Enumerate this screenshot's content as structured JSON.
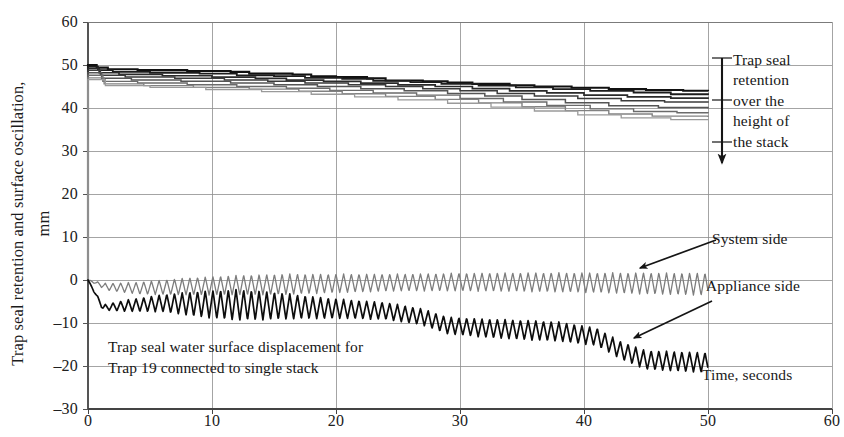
{
  "chart_data": {
    "type": "line",
    "title": "",
    "xlabel": "Time, seconds",
    "ylabel": "Trap seal retention and surface oscillation,\nmm",
    "xlim": [
      0,
      60
    ],
    "ylim": [
      -30,
      60
    ],
    "xticks": [
      "0",
      "10",
      "20",
      "30",
      "40",
      "50",
      "60"
    ],
    "yticks": [
      "60",
      "50",
      "40",
      "30",
      "20",
      "10",
      "0",
      "–10",
      "–20",
      "–30"
    ],
    "grid": true,
    "legend_position": "inline-annotations",
    "annotations": [
      {
        "name": "trap-seal-retention-bracket",
        "text": "Trap seal\nretention\nover the\nheight of\nthe stack",
        "arrow": "down"
      },
      {
        "name": "system-side-callout",
        "text": "System side",
        "arrow": "down-left"
      },
      {
        "name": "appliance-side-callout",
        "text": "Appliance side",
        "arrow": "down-left"
      },
      {
        "name": "caption",
        "text": "Trap seal water surface displacement for\nTrap 19 connected to single stack",
        "arrow": "none"
      }
    ],
    "series": [
      {
        "name": "Trap seal retention — stack level 1",
        "group": "retention",
        "color": "#111111",
        "width": 2.1,
        "points": [
          [
            0,
            0
          ],
          [
            0.2,
            50
          ],
          [
            0.7,
            49.4
          ],
          [
            1.6,
            49.0
          ],
          [
            4.0,
            48.8
          ],
          [
            8.0,
            48.6
          ],
          [
            11.5,
            48.4
          ],
          [
            13.0,
            48.0
          ],
          [
            16.5,
            47.8
          ],
          [
            18.0,
            47.4
          ],
          [
            20.0,
            47.2
          ],
          [
            22.5,
            46.9
          ],
          [
            24.0,
            46.4
          ],
          [
            27.0,
            46.2
          ],
          [
            29.0,
            45.9
          ],
          [
            31.0,
            45.6
          ],
          [
            34.0,
            45.3
          ],
          [
            36.0,
            45.0
          ],
          [
            39.0,
            44.7
          ],
          [
            42.0,
            44.4
          ],
          [
            45.0,
            44.2
          ],
          [
            48.0,
            44.0
          ],
          [
            50.0,
            43.9
          ]
        ]
      },
      {
        "name": "Trap seal retention — stack level 2",
        "group": "retention",
        "color": "#1c1c1c",
        "width": 1.8,
        "points": [
          [
            0,
            0
          ],
          [
            0.2,
            49.6
          ],
          [
            0.8,
            48.8
          ],
          [
            2.0,
            48.4
          ],
          [
            5.0,
            48.2
          ],
          [
            9.0,
            48.0
          ],
          [
            12.0,
            47.6
          ],
          [
            15.0,
            47.4
          ],
          [
            17.5,
            47.0
          ],
          [
            20.5,
            46.8
          ],
          [
            23.0,
            46.3
          ],
          [
            26.0,
            46.0
          ],
          [
            28.5,
            45.6
          ],
          [
            31.5,
            45.2
          ],
          [
            34.5,
            44.8
          ],
          [
            37.5,
            44.4
          ],
          [
            40.5,
            44.0
          ],
          [
            44.0,
            43.6
          ],
          [
            47.0,
            43.2
          ],
          [
            50.0,
            43.0
          ]
        ]
      },
      {
        "name": "Trap seal retention — stack level 3",
        "group": "retention",
        "color": "#2a2a2a",
        "width": 1.7,
        "points": [
          [
            0,
            0
          ],
          [
            0.2,
            49.2
          ],
          [
            0.9,
            48.2
          ],
          [
            2.5,
            47.8
          ],
          [
            6.0,
            47.5
          ],
          [
            10.0,
            47.2
          ],
          [
            13.5,
            46.9
          ],
          [
            16.0,
            46.5
          ],
          [
            19.0,
            46.2
          ],
          [
            22.0,
            45.8
          ],
          [
            25.0,
            45.4
          ],
          [
            28.0,
            45.0
          ],
          [
            31.0,
            44.5
          ],
          [
            34.0,
            44.0
          ],
          [
            37.0,
            43.5
          ],
          [
            40.0,
            43.0
          ],
          [
            43.5,
            42.6
          ],
          [
            47.0,
            42.3
          ],
          [
            50.0,
            42.1
          ]
        ]
      },
      {
        "name": "Trap seal retention — stack level 4",
        "group": "retention",
        "color": "#3b3b3b",
        "width": 1.5,
        "points": [
          [
            0,
            0
          ],
          [
            0.2,
            48.8
          ],
          [
            1.0,
            47.6
          ],
          [
            3.0,
            47.2
          ],
          [
            7.0,
            46.9
          ],
          [
            11.0,
            46.5
          ],
          [
            14.5,
            46.2
          ],
          [
            17.5,
            45.8
          ],
          [
            21.0,
            45.4
          ],
          [
            24.0,
            45.0
          ],
          [
            27.0,
            44.5
          ],
          [
            30.0,
            44.0
          ],
          [
            33.0,
            43.4
          ],
          [
            36.0,
            42.8
          ],
          [
            39.5,
            42.2
          ],
          [
            43.0,
            41.7
          ],
          [
            46.5,
            41.4
          ],
          [
            50.0,
            41.2
          ]
        ]
      },
      {
        "name": "Trap seal retention — stack level 5",
        "group": "retention",
        "color": "#555555",
        "width": 1.5,
        "points": [
          [
            0,
            0
          ],
          [
            0.2,
            48.2
          ],
          [
            1.1,
            46.9
          ],
          [
            3.5,
            46.5
          ],
          [
            7.5,
            46.2
          ],
          [
            11.5,
            45.8
          ],
          [
            15.0,
            45.4
          ],
          [
            18.5,
            45.0
          ],
          [
            22.0,
            44.5
          ],
          [
            25.5,
            44.0
          ],
          [
            29.0,
            43.4
          ],
          [
            32.0,
            42.8
          ],
          [
            35.0,
            42.0
          ],
          [
            38.5,
            41.2
          ],
          [
            42.0,
            40.5
          ],
          [
            46.0,
            40.1
          ],
          [
            50.0,
            39.9
          ]
        ]
      },
      {
        "name": "Trap seal retention — stack level 6",
        "group": "retention",
        "color": "#6b6b6b",
        "width": 1.4,
        "points": [
          [
            0,
            0
          ],
          [
            0.2,
            47.6
          ],
          [
            1.2,
            46.2
          ],
          [
            4.0,
            45.8
          ],
          [
            8.0,
            45.4
          ],
          [
            12.0,
            45.0
          ],
          [
            16.0,
            44.6
          ],
          [
            19.5,
            44.1
          ],
          [
            23.0,
            43.5
          ],
          [
            26.5,
            43.0
          ],
          [
            30.0,
            42.2
          ],
          [
            33.5,
            41.4
          ],
          [
            37.0,
            40.6
          ],
          [
            40.5,
            39.8
          ],
          [
            44.0,
            39.2
          ],
          [
            47.5,
            38.9
          ],
          [
            50.0,
            38.8
          ]
        ]
      },
      {
        "name": "Trap seal retention — stack level 7",
        "group": "retention",
        "color": "#828282",
        "width": 1.4,
        "points": [
          [
            0,
            0
          ],
          [
            0.2,
            47.0
          ],
          [
            1.3,
            45.6
          ],
          [
            4.5,
            45.2
          ],
          [
            8.5,
            44.8
          ],
          [
            13.0,
            44.4
          ],
          [
            17.0,
            43.9
          ],
          [
            20.5,
            43.3
          ],
          [
            24.0,
            42.7
          ],
          [
            28.0,
            42.0
          ],
          [
            31.5,
            41.2
          ],
          [
            35.0,
            40.3
          ],
          [
            38.5,
            39.4
          ],
          [
            42.0,
            38.6
          ],
          [
            45.5,
            38.1
          ],
          [
            50.0,
            37.9
          ]
        ]
      },
      {
        "name": "Trap seal retention — stack level 8",
        "group": "retention",
        "color": "#9a9a9a",
        "width": 1.3,
        "points": [
          [
            0,
            0
          ],
          [
            0.2,
            46.6
          ],
          [
            1.4,
            45.2
          ],
          [
            5.0,
            44.8
          ],
          [
            9.5,
            44.3
          ],
          [
            14.0,
            43.8
          ],
          [
            18.0,
            43.2
          ],
          [
            21.5,
            42.6
          ],
          [
            25.0,
            41.9
          ],
          [
            29.0,
            41.1
          ],
          [
            32.5,
            40.2
          ],
          [
            36.0,
            39.3
          ],
          [
            39.5,
            38.4
          ],
          [
            43.0,
            37.7
          ],
          [
            47.0,
            37.3
          ],
          [
            50.0,
            37.2
          ]
        ]
      },
      {
        "name": "System side",
        "group": "oscillation",
        "color": "#7d7d7d",
        "width": 1.3,
        "baseline": [
          [
            0,
            0
          ],
          [
            1.5,
            -1.6
          ],
          [
            4,
            -1.9
          ],
          [
            8,
            -1.5
          ],
          [
            12,
            -1.2
          ],
          [
            16,
            -1.0
          ],
          [
            20,
            -0.8
          ],
          [
            25,
            -0.6
          ],
          [
            30,
            -0.5
          ],
          [
            35,
            -0.5
          ],
          [
            40,
            -0.6
          ],
          [
            45,
            -0.8
          ],
          [
            50,
            -1.0
          ]
        ],
        "amplitude": [
          [
            0,
            0
          ],
          [
            1.5,
            0.8
          ],
          [
            4,
            1.4
          ],
          [
            8,
            2.0
          ],
          [
            12,
            2.3
          ],
          [
            16,
            2.4
          ],
          [
            20,
            2.2
          ],
          [
            25,
            2.0
          ],
          [
            30,
            2.1
          ],
          [
            35,
            2.2
          ],
          [
            40,
            2.3
          ],
          [
            45,
            2.5
          ],
          [
            50,
            2.6
          ]
        ],
        "period_seconds": 0.62
      },
      {
        "name": "Appliance side",
        "group": "oscillation",
        "color": "#0d0d0d",
        "width": 1.7,
        "baseline": [
          [
            0,
            0
          ],
          [
            1.2,
            -6.4
          ],
          [
            3,
            -6.0
          ],
          [
            6,
            -5.4
          ],
          [
            9,
            -5.6
          ],
          [
            12,
            -5.8
          ],
          [
            15,
            -6.0
          ],
          [
            18,
            -6.4
          ],
          [
            21,
            -6.8
          ],
          [
            24,
            -7.2
          ],
          [
            27,
            -8.6
          ],
          [
            29,
            -10.6
          ],
          [
            32,
            -11.2
          ],
          [
            35,
            -11.6
          ],
          [
            38,
            -12.0
          ],
          [
            41,
            -13.2
          ],
          [
            43,
            -16.4
          ],
          [
            45,
            -18.6
          ],
          [
            48,
            -19.0
          ],
          [
            50,
            -19.2
          ]
        ],
        "amplitude": [
          [
            0,
            0
          ],
          [
            1.2,
            0.6
          ],
          [
            3,
            1.3
          ],
          [
            6,
            2.0
          ],
          [
            9,
            3.0
          ],
          [
            12,
            3.6
          ],
          [
            15,
            3.2
          ],
          [
            18,
            2.6
          ],
          [
            21,
            2.2
          ],
          [
            24,
            2.0
          ],
          [
            27,
            1.9
          ],
          [
            30,
            2.0
          ],
          [
            33,
            2.2
          ],
          [
            36,
            2.3
          ],
          [
            39,
            2.2
          ],
          [
            42,
            2.0
          ],
          [
            45,
            2.2
          ],
          [
            48,
            2.3
          ],
          [
            50,
            2.3
          ]
        ],
        "period_seconds": 0.62
      }
    ]
  },
  "axis": {
    "ylabel_text": "Trap seal retention and surface oscillation,\nmm",
    "xlabel_text": "Time, seconds"
  },
  "annotations": {
    "retention": "Trap seal\nretention\nover the\nheight of\nthe stack",
    "system_side": "System side",
    "appliance_side": "Appliance side",
    "caption": "Trap seal water surface displacement for\nTrap 19 connected to single stack"
  },
  "colors": {
    "axis": "#6e6e6e",
    "grid": "#8d8d8d",
    "retention_dark": "#111111",
    "system_side": "#7d7d7d",
    "appliance_side": "#0d0d0d",
    "text": "#1a1a1a"
  }
}
